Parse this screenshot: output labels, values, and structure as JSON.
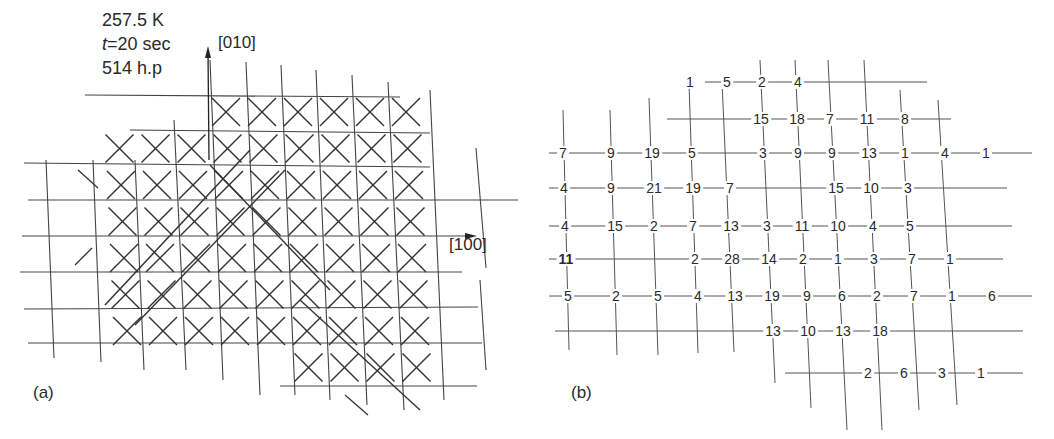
{
  "panel_a": {
    "label": "(a)",
    "conditions": {
      "temperature": "257.5 K",
      "time_var": "t",
      "time_value": "=20 sec",
      "pulses": "514 h.p"
    },
    "axis_y_label": "[010]",
    "axis_x_label": "[100]",
    "description": "Square lattice grid with X / diagonal marks indicating tilted cells"
  },
  "panel_b": {
    "label": "(b)",
    "rows": [
      {
        "y": 82,
        "values": [
          {
            "x": 163,
            "v": "1"
          },
          {
            "x": 200,
            "v": "5"
          },
          {
            "x": 235,
            "v": "2"
          },
          {
            "x": 271,
            "v": "4"
          }
        ]
      },
      {
        "y": 119,
        "values": [
          {
            "x": 234,
            "v": "15"
          },
          {
            "x": 270,
            "v": "18"
          },
          {
            "x": 303,
            "v": "7"
          },
          {
            "x": 340,
            "v": "11"
          },
          {
            "x": 378,
            "v": "8"
          }
        ]
      },
      {
        "y": 153,
        "values": [
          {
            "x": 36,
            "v": "7"
          },
          {
            "x": 84,
            "v": "9"
          },
          {
            "x": 125,
            "v": "19"
          },
          {
            "x": 165,
            "v": "5"
          },
          {
            "x": 236,
            "v": "3"
          },
          {
            "x": 271,
            "v": "9"
          },
          {
            "x": 305,
            "v": "9"
          },
          {
            "x": 342,
            "v": "13"
          },
          {
            "x": 378,
            "v": "1"
          },
          {
            "x": 418,
            "v": "4"
          },
          {
            "x": 459,
            "v": "1"
          }
        ]
      },
      {
        "y": 188,
        "values": [
          {
            "x": 37,
            "v": "4"
          },
          {
            "x": 84,
            "v": "9"
          },
          {
            "x": 127,
            "v": "21"
          },
          {
            "x": 166,
            "v": "19"
          },
          {
            "x": 203,
            "v": "7"
          },
          {
            "x": 309,
            "v": "15"
          },
          {
            "x": 344,
            "v": "10"
          },
          {
            "x": 381,
            "v": "3"
          }
        ]
      },
      {
        "y": 226,
        "values": [
          {
            "x": 38,
            "v": "4"
          },
          {
            "x": 88,
            "v": "15"
          },
          {
            "x": 127,
            "v": "2"
          },
          {
            "x": 166,
            "v": "7"
          },
          {
            "x": 204,
            "v": "13"
          },
          {
            "x": 240,
            "v": "3"
          },
          {
            "x": 275,
            "v": "11"
          },
          {
            "x": 311,
            "v": "10"
          },
          {
            "x": 346,
            "v": "4"
          },
          {
            "x": 383,
            "v": "5"
          }
        ]
      },
      {
        "y": 259,
        "values": [
          {
            "x": 39,
            "v": "11"
          },
          {
            "x": 168,
            "v": "2"
          },
          {
            "x": 205,
            "v": "28"
          },
          {
            "x": 242,
            "v": "14"
          },
          {
            "x": 276,
            "v": "2"
          },
          {
            "x": 311,
            "v": "1"
          },
          {
            "x": 347,
            "v": "3"
          },
          {
            "x": 385,
            "v": "7"
          },
          {
            "x": 423,
            "v": "1"
          }
        ]
      },
      {
        "y": 296,
        "values": [
          {
            "x": 41,
            "v": "5"
          },
          {
            "x": 89,
            "v": "2"
          },
          {
            "x": 131,
            "v": "5"
          },
          {
            "x": 171,
            "v": "4"
          },
          {
            "x": 208,
            "v": "13"
          },
          {
            "x": 245,
            "v": "19"
          },
          {
            "x": 280,
            "v": "9"
          },
          {
            "x": 315,
            "v": "6"
          },
          {
            "x": 350,
            "v": "2"
          },
          {
            "x": 387,
            "v": "7"
          },
          {
            "x": 425,
            "v": "1"
          },
          {
            "x": 465,
            "v": "6"
          }
        ]
      },
      {
        "y": 331,
        "values": [
          {
            "x": 246,
            "v": "13"
          },
          {
            "x": 281,
            "v": "10"
          },
          {
            "x": 316,
            "v": "13"
          },
          {
            "x": 353,
            "v": "18"
          }
        ]
      },
      {
        "y": 373,
        "values": [
          {
            "x": 341,
            "v": "2"
          },
          {
            "x": 377,
            "v": "6"
          },
          {
            "x": 415,
            "v": "3"
          },
          {
            "x": 454,
            "v": "1"
          }
        ]
      }
    ]
  }
}
